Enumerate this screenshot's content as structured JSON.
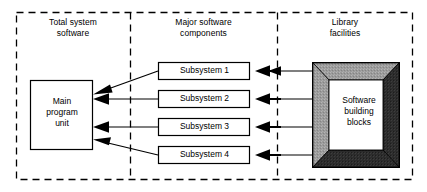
{
  "diagram": {
    "background_color": "#ffffff",
    "line_color": "#000000",
    "zones": [
      {
        "id": "total-system-software",
        "label": "Total system\nsoftware",
        "border_style": "dashed"
      },
      {
        "id": "major-software-components",
        "label": "Major software\ncomponents",
        "border_style": "dashed"
      },
      {
        "id": "library-facilities",
        "label": "Library\nfacilities",
        "border_style": "dashed"
      }
    ],
    "nodes": {
      "main_program_unit": {
        "label": "Main\nprogram\nunit",
        "shape": "rectangle",
        "fill": "#ffffff",
        "stroke": "#000000"
      },
      "library_block": {
        "label": "Software\nbuilding\nblocks",
        "shape": "beveled-frame",
        "fill_center": "#ffffff",
        "bevel_light": "#9a9a9a",
        "bevel_dark": "#2b2b2b",
        "stroke": "#000000"
      },
      "subsystems": [
        {
          "label": "Subsystem 1",
          "arrow_to_main": "diagonal-down-left"
        },
        {
          "label": "Subsystem 2",
          "arrow_to_main": "horizontal"
        },
        {
          "label": "Subsystem 3",
          "arrow_to_main": "horizontal"
        },
        {
          "label": "Subsystem 4",
          "arrow_to_main": "diagonal-up-left"
        }
      ]
    },
    "arrows": {
      "count": 8,
      "head_style": "solid-filled-triangle",
      "direction": "right-to-left",
      "library_to_subsystem_count": 4,
      "subsystem_to_main_count": 4
    }
  }
}
